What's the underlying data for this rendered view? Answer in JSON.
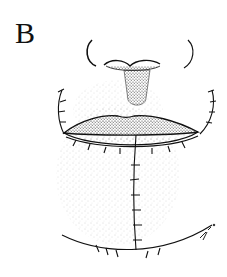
{
  "figure": {
    "panel_label": "B",
    "style": "stippled pen-and-ink drawing",
    "elements": [
      "nose",
      "columella-philtrum",
      "upper-lip",
      "lower-lip",
      "vertical-chin-suture-line",
      "curved-submental-suture-line",
      "lateral-suture-lines",
      "artist-signature"
    ],
    "colors": {
      "ink": "#111111",
      "background": "#ffffff",
      "stipple": "#555555"
    }
  }
}
